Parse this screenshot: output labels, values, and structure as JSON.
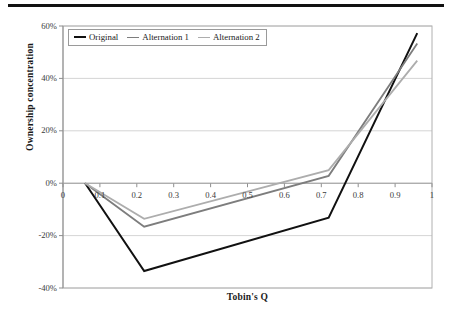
{
  "figure": {
    "has_top_rule": true
  },
  "chart_data": {
    "type": "line",
    "title": "",
    "xlabel": "Tobin's Q",
    "ylabel": "Ownership concentration",
    "xlim": [
      0,
      1
    ],
    "ylim": [
      -0.4,
      0.6
    ],
    "ytick_labels": [
      "60%",
      "40%",
      "20%",
      "0%",
      "-20%",
      "-40%"
    ],
    "ytick_values": [
      0.6,
      0.4,
      0.2,
      0.0,
      -0.2,
      -0.4
    ],
    "xtick_labels": [
      "0",
      "0.1",
      "0.2",
      "0.3",
      "0.4",
      "0.5",
      "0.6",
      "0.7",
      "0.8",
      "0.9",
      "1"
    ],
    "xtick_values": [
      0,
      0.1,
      0.2,
      0.3,
      0.4,
      0.5,
      0.6,
      0.7,
      0.8,
      0.9,
      1.0
    ],
    "grid": "horizontal",
    "legend_position": "top-left-inside",
    "series": [
      {
        "name": "Original",
        "color": "#111111",
        "width": 2.0,
        "x": [
          0.06,
          0.22,
          0.72,
          0.96
        ],
        "y": [
          0.0,
          -0.335,
          -0.132,
          0.573
        ]
      },
      {
        "name": "Alternation 1",
        "color": "#7d7d7d",
        "width": 1.8,
        "x": [
          0.06,
          0.22,
          0.72,
          0.96
        ],
        "y": [
          0.0,
          -0.166,
          0.028,
          0.533
        ]
      },
      {
        "name": "Alternation 2",
        "color": "#adadad",
        "width": 1.8,
        "x": [
          0.06,
          0.22,
          0.72,
          0.96
        ],
        "y": [
          0.0,
          -0.136,
          0.05,
          0.468
        ]
      }
    ]
  }
}
